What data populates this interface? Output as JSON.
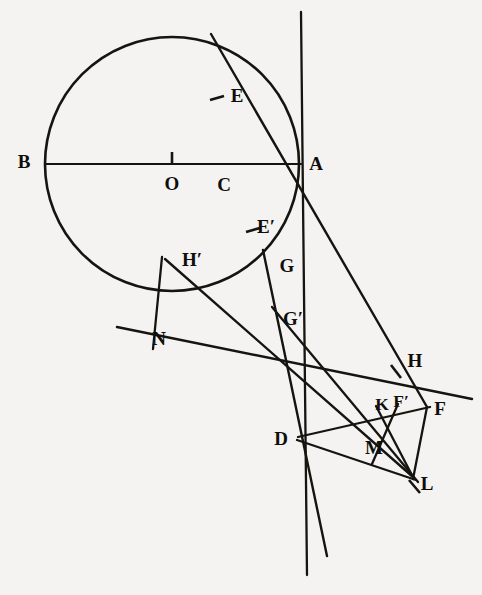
{
  "figure": {
    "type": "geometric-construction-diagram",
    "title": "",
    "canvas": {
      "width": 482,
      "height": 595
    },
    "background_color": "#f4f3f1",
    "ink_color": "#16140f",
    "circle": {
      "center": {
        "x": 172,
        "y": 164
      },
      "radius": 127,
      "stroke_width": 2.6
    },
    "labels": [
      {
        "name": "B",
        "text": "B",
        "x": 24,
        "y": 164,
        "size": "normal"
      },
      {
        "name": "A",
        "text": "A",
        "x": 316,
        "y": 166,
        "size": "normal"
      },
      {
        "name": "O",
        "text": "O",
        "x": 172,
        "y": 186,
        "size": "normal"
      },
      {
        "name": "C",
        "text": "C",
        "x": 224,
        "y": 187,
        "size": "normal"
      },
      {
        "name": "E",
        "text": "E",
        "x": 237,
        "y": 98,
        "size": "normal"
      },
      {
        "name": "E-prime",
        "text": "E′",
        "x": 264,
        "y": 229,
        "size": "normal"
      },
      {
        "name": "G",
        "text": "G",
        "x": 286,
        "y": 268,
        "size": "normal"
      },
      {
        "name": "G-prime",
        "text": "G′",
        "x": 291,
        "y": 321,
        "size": "normal"
      },
      {
        "name": "H-prime",
        "text": "H′",
        "x": 190,
        "y": 263,
        "size": "normal"
      },
      {
        "name": "N",
        "text": "N",
        "x": 158,
        "y": 340,
        "size": "normal"
      },
      {
        "name": "H",
        "text": "H",
        "x": 415,
        "y": 363,
        "size": "normal"
      },
      {
        "name": "K",
        "text": "K",
        "x": 382,
        "y": 405,
        "size": "small"
      },
      {
        "name": "F-prime",
        "text": "F′",
        "x": 400,
        "y": 403,
        "size": "small"
      },
      {
        "name": "F",
        "text": "F",
        "x": 439,
        "y": 410,
        "size": "normal"
      },
      {
        "name": "D",
        "text": "D",
        "x": 281,
        "y": 441,
        "size": "normal"
      },
      {
        "name": "M",
        "text": "M",
        "x": 374,
        "y": 449,
        "size": "normal"
      },
      {
        "name": "L",
        "text": "L",
        "x": 426,
        "y": 485,
        "size": "normal"
      }
    ],
    "points": {
      "B": {
        "x": 46,
        "y": 164
      },
      "A": {
        "x": 299,
        "y": 164
      },
      "O": {
        "x": 172,
        "y": 164
      },
      "C": {
        "x": 224,
        "y": 168
      },
      "E": {
        "x": 218,
        "y": 99
      },
      "Ep": {
        "x": 254,
        "y": 231
      },
      "G": {
        "x": 272,
        "y": 269
      },
      "Gp": {
        "x": 281,
        "y": 322
      },
      "Hp": {
        "x": 180,
        "y": 272
      },
      "N": {
        "x": 146,
        "y": 340
      },
      "H": {
        "x": 399,
        "y": 374
      },
      "K": {
        "x": 385,
        "y": 412
      },
      "Fp": {
        "x": 398,
        "y": 410
      },
      "F": {
        "x": 427,
        "y": 407
      },
      "D": {
        "x": 298,
        "y": 437
      },
      "M": {
        "x": 378,
        "y": 456
      },
      "L": {
        "x": 413,
        "y": 477
      },
      "chord_top": {
        "x": 211,
        "y": 34
      },
      "tangent_top": {
        "x": 301,
        "y": 12
      },
      "tangent_bot": {
        "x": 307,
        "y": 575
      },
      "diag_left": {
        "x": 117,
        "y": 327
      },
      "hp_seg_start": {
        "x": 162,
        "y": 257
      },
      "hp_seg_end": {
        "x": 153,
        "y": 349
      },
      "f_right_end": {
        "x": 472,
        "y": 399
      },
      "d_slant_end": {
        "x": 327,
        "y": 556
      },
      "l_tick_end": {
        "x": 420,
        "y": 493
      }
    },
    "tick_marks": [
      {
        "name": "tick-at-O",
        "x1": 172,
        "y1": 153,
        "x2": 172,
        "y2": 165
      },
      {
        "name": "tick-at-E",
        "x1": 210,
        "y1": 100,
        "x2": 223,
        "y2": 97
      },
      {
        "name": "tick-at-E-prime",
        "x1": 246,
        "y1": 231,
        "x2": 259,
        "y2": 228
      },
      {
        "name": "tick-at-H",
        "x1": 391,
        "y1": 366,
        "x2": 400,
        "y2": 378
      },
      {
        "name": "tick-at-L",
        "x1": 410,
        "y1": 481,
        "x2": 419,
        "y2": 492
      }
    ]
  }
}
